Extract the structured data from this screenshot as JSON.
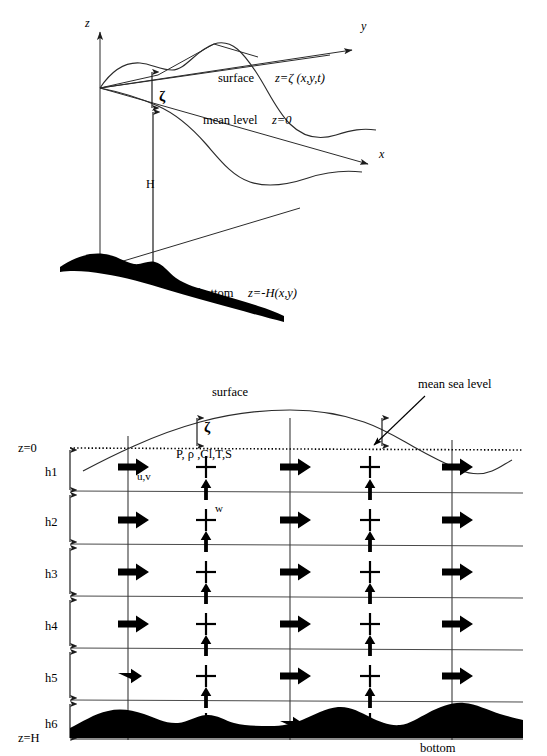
{
  "figure": {
    "domain": "diagram",
    "background_color": "#ffffff",
    "ink_color": "#000000"
  },
  "upper_diagram": {
    "name": "3d-coordinate-system-sea-surface-bottom",
    "axes": [
      {
        "id": "z",
        "label": "z",
        "direction": "up"
      },
      {
        "id": "y",
        "label": "y",
        "direction": "upper-right"
      },
      {
        "id": "x",
        "label": "x",
        "direction": "lower-right"
      }
    ],
    "annotations": [
      {
        "id": "surface",
        "label": "surface",
        "equation": "z=ζ (x,y,t)"
      },
      {
        "id": "mean-level",
        "label": "mean level",
        "equation": "z=0"
      },
      {
        "id": "bottom",
        "label": "bottom",
        "equation": "z=-H(x,y)"
      }
    ],
    "dimensions": [
      {
        "id": "zeta",
        "label": "ζ",
        "meaning": "surface elevation above mean level"
      },
      {
        "id": "H",
        "label": "H",
        "meaning": "total water depth"
      }
    ]
  },
  "lower_diagram": {
    "name": "layered-vertical-grid-cross-section",
    "levels": {
      "mean_sea_level_label": "z=0",
      "bottom_level_label": "z=H"
    },
    "layers": [
      {
        "id": "h1",
        "label": "h1"
      },
      {
        "id": "h2",
        "label": "h2"
      },
      {
        "id": "h3",
        "label": "h3"
      },
      {
        "id": "h4",
        "label": "h4"
      },
      {
        "id": "h5",
        "label": "h5"
      },
      {
        "id": "h6",
        "label": "h6"
      }
    ],
    "annotations": [
      {
        "id": "surface",
        "label": "surface"
      },
      {
        "id": "mean-sea-level",
        "label": "mean sea level"
      },
      {
        "id": "zeta",
        "label": "ζ"
      },
      {
        "id": "scalars",
        "label": "P, ρ ,Cl,T,S"
      },
      {
        "id": "horizontal-velocity",
        "label": "u,v"
      },
      {
        "id": "vertical-velocity",
        "label": "w"
      },
      {
        "id": "bottom",
        "label": "bottom"
      }
    ],
    "grid": {
      "layer_count": 6,
      "velocity_columns": 3,
      "scalar_columns": 2
    }
  }
}
